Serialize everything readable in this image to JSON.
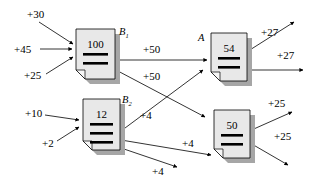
{
  "diagram": {
    "background_color": "#ffffff",
    "stroke_color": "#000000",
    "doc_fill_color": "#e8e8e8",
    "doc_shadow_color": "#a6a6a6",
    "bar_color": "#000000"
  },
  "nodes": [
    {
      "id": "b1",
      "name": "B",
      "subscript": "1",
      "value": "100",
      "x": 76,
      "y": 29,
      "w": 39,
      "h": 50,
      "bars": 2,
      "label_x": 119,
      "label_y": 35
    },
    {
      "id": "a",
      "name": "A",
      "subscript": "",
      "value": "54",
      "x": 211,
      "y": 33,
      "w": 36,
      "h": 48,
      "bars": 2,
      "label_x": 198,
      "label_y": 41
    },
    {
      "id": "b2",
      "name": "B",
      "subscript": "2",
      "value": "12",
      "x": 83,
      "y": 99,
      "w": 37,
      "h": 51,
      "bars": 3,
      "label_x": 122,
      "label_y": 103
    },
    {
      "id": "d50",
      "name": "",
      "subscript": "",
      "value": "50",
      "x": 214,
      "y": 110,
      "w": 36,
      "h": 48,
      "bars": 2,
      "label_x": 0,
      "label_y": 0
    }
  ],
  "edges": [
    {
      "id": "in-30",
      "label": "+30",
      "label_x": 27,
      "label_y": 18,
      "x1": 39,
      "y1": 22,
      "x2": 73,
      "y2": 44
    },
    {
      "id": "in-45",
      "label": "+45",
      "label_x": 14,
      "label_y": 53,
      "x1": 40,
      "y1": 49,
      "x2": 72,
      "y2": 49
    },
    {
      "id": "in-25",
      "label": "+25",
      "label_x": 24,
      "label_y": 79,
      "x1": 46,
      "y1": 74,
      "x2": 73,
      "y2": 57
    },
    {
      "id": "b1-a-50",
      "label": "+50",
      "label_x": 143,
      "label_y": 53,
      "x1": 116,
      "y1": 60,
      "x2": 207,
      "y2": 60
    },
    {
      "id": "b1-d50-50",
      "label": "+50",
      "label_x": 143,
      "label_y": 80,
      "x1": 116,
      "y1": 70,
      "x2": 205,
      "y2": 117
    },
    {
      "id": "b2-a-4",
      "label": "+4",
      "label_x": 140,
      "label_y": 119,
      "x1": 121,
      "y1": 131,
      "x2": 203,
      "y2": 70
    },
    {
      "id": "b2-right-4a",
      "label": "+4",
      "label_x": 182,
      "label_y": 147,
      "x1": 121,
      "y1": 140,
      "x2": 211,
      "y2": 155
    },
    {
      "id": "b2-right-4b",
      "label": "+4",
      "label_x": 152,
      "label_y": 175,
      "x1": 121,
      "y1": 148,
      "x2": 177,
      "y2": 167
    },
    {
      "id": "in-10",
      "label": "+10",
      "label_x": 25,
      "label_y": 117,
      "x1": 45,
      "y1": 115,
      "x2": 79,
      "y2": 120
    },
    {
      "id": "in-2",
      "label": "+2",
      "label_x": 42,
      "label_y": 147,
      "x1": 57,
      "y1": 141,
      "x2": 79,
      "y2": 127
    },
    {
      "id": "a-out-27a",
      "label": "+27",
      "label_x": 261,
      "label_y": 36,
      "x1": 234,
      "y1": 60,
      "x2": 294,
      "y2": 22
    },
    {
      "id": "a-out-27b",
      "label": "+27",
      "label_x": 277,
      "label_y": 59,
      "x1": 240,
      "y1": 70,
      "x2": 303,
      "y2": 70
    },
    {
      "id": "d50-out-25a",
      "label": "+25",
      "label_x": 268,
      "label_y": 107,
      "x1": 238,
      "y1": 136,
      "x2": 292,
      "y2": 112
    },
    {
      "id": "d50-out-25b",
      "label": "+25",
      "label_x": 274,
      "label_y": 140,
      "x1": 238,
      "y1": 136,
      "x2": 288,
      "y2": 165
    }
  ]
}
